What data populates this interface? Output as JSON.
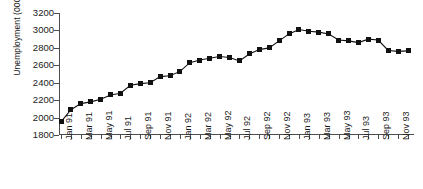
{
  "chart_data": {
    "type": "line",
    "title": "",
    "xlabel": "",
    "ylabel": "Unemployment (000s)",
    "ylim": [
      1800,
      3200
    ],
    "ytick_values": [
      1800,
      2000,
      2200,
      2400,
      2600,
      2800,
      3000,
      3200
    ],
    "ytick_labels": [
      "1800",
      "2000",
      "2200",
      "2400",
      "2600",
      "2800",
      "3000",
      "3200"
    ],
    "grid": false,
    "legend": false,
    "marker": "filled-square",
    "line_color": "#111111",
    "axis_color": "#4d4d4d",
    "x": [
      "Jan 91",
      "Feb 91",
      "Mar 91",
      "Apr 91",
      "May 91",
      "Jun 91",
      "Jul 91",
      "Aug 91",
      "Sep 91",
      "Oct 91",
      "Nov 91",
      "Dec 91",
      "Jan 92",
      "Feb 92",
      "Mar 92",
      "Apr 92",
      "May 92",
      "Jun 92",
      "Jul 92",
      "Aug 92",
      "Sep 92",
      "Oct 92",
      "Nov 92",
      "Dec 92",
      "Jan 93",
      "Feb 93",
      "Mar 93",
      "Apr 93",
      "May 93",
      "Jun 93",
      "Jul 93",
      "Aug 93",
      "Sep 93",
      "Oct 93",
      "Nov 93",
      "Dec 93"
    ],
    "xtick_labels": [
      "Jan 91",
      "Mar 91",
      "May 91",
      "Jul 91",
      "Sep 91",
      "Nov 91",
      "Jan 92",
      "Mar 92",
      "May 92",
      "Jul 92",
      "Sep 92",
      "Nov 92",
      "Jan 93",
      "Mar 93",
      "May 93",
      "Jul 93",
      "Sep 93",
      "Nov 93"
    ],
    "values": [
      1950,
      2090,
      2160,
      2180,
      2210,
      2260,
      2280,
      2370,
      2390,
      2400,
      2470,
      2480,
      2530,
      2630,
      2660,
      2680,
      2700,
      2690,
      2650,
      2730,
      2780,
      2800,
      2880,
      2960,
      3010,
      2990,
      2980,
      2960,
      2890,
      2880,
      2860,
      2900,
      2890,
      2770,
      2760,
      2765
    ]
  }
}
